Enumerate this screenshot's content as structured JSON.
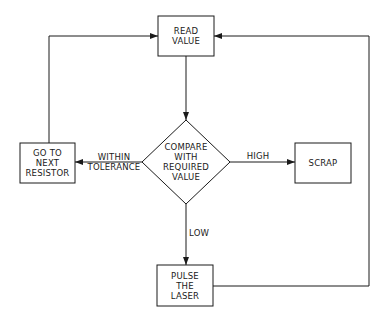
{
  "diagram": {
    "type": "flowchart",
    "nodes": {
      "read_value": {
        "shape": "rectangle",
        "lines": [
          "READ",
          "VALUE"
        ]
      },
      "compare": {
        "shape": "diamond",
        "lines": [
          "COMPARE",
          "WITH",
          "REQUIRED",
          "VALUE"
        ]
      },
      "go_to_next": {
        "shape": "rectangle",
        "lines": [
          "GO TO",
          "NEXT",
          "RESISTOR"
        ]
      },
      "scrap": {
        "shape": "rectangle",
        "lines": [
          "SCRAP"
        ]
      },
      "pulse_laser": {
        "shape": "rectangle",
        "lines": [
          "PULSE",
          "THE",
          "LASER"
        ]
      }
    },
    "edges": {
      "read_to_compare": {
        "from": "READ VALUE",
        "to": "COMPARE WITH REQUIRED VALUE",
        "label": ""
      },
      "within": {
        "from": "COMPARE WITH REQUIRED VALUE",
        "to": "GO TO NEXT RESISTOR",
        "lines": [
          "WITHIN",
          "TOLERANCE"
        ]
      },
      "high": {
        "from": "COMPARE WITH REQUIRED VALUE",
        "to": "SCRAP",
        "label": "HIGH"
      },
      "low": {
        "from": "COMPARE WITH REQUIRED VALUE",
        "to": "PULSE THE LASER",
        "label": "LOW"
      },
      "next_to_read": {
        "from": "GO TO NEXT RESISTOR",
        "to": "READ VALUE",
        "label": ""
      },
      "pulse_to_read": {
        "from": "PULSE THE LASER",
        "to": "READ VALUE",
        "label": ""
      }
    },
    "colors": {
      "line": "#1a1a1a",
      "background": "#ffffff"
    }
  }
}
